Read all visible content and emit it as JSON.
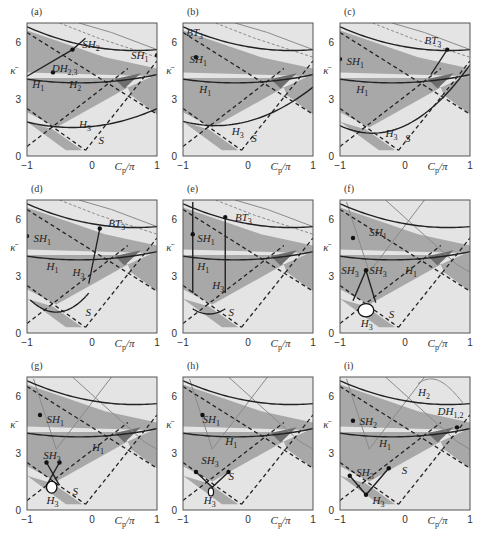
{
  "figure": {
    "colors": {
      "background": "#ffffff",
      "light_region": "#e4e4e4",
      "medium_region": "#a8a8a8",
      "dark_region": "#6e6e6e",
      "curve_solid": "#222222",
      "curve_grey": "#8a8a8a",
      "frame": "#555555"
    },
    "axes": {
      "xlabel": "C_p/π",
      "ylabel": "κ̄",
      "xticks": [
        "−1",
        "0",
        "1"
      ],
      "yticks": [
        "0",
        "3",
        "6"
      ],
      "xlim": [
        -1,
        1
      ],
      "ylim": [
        0,
        7
      ]
    },
    "panels": [
      {
        "id": "a",
        "label": "(a)",
        "curve_labels": [
          "SH2",
          "SH1",
          "DH2,3",
          "H1",
          "H2",
          "H3",
          "S"
        ]
      },
      {
        "id": "b",
        "label": "(b)",
        "curve_labels": [
          "BT3",
          "SH1",
          "H1",
          "H3",
          "S"
        ]
      },
      {
        "id": "c",
        "label": "(c)",
        "curve_labels": [
          "BT3",
          "SH1",
          "H1",
          "H3",
          "S"
        ]
      },
      {
        "id": "d",
        "label": "(d)",
        "curve_labels": [
          "SH1",
          "BT3",
          "H1",
          "H3",
          "S"
        ]
      },
      {
        "id": "e",
        "label": "(e)",
        "curve_labels": [
          "BT3",
          "SH1",
          "H1",
          "H3",
          "S"
        ]
      },
      {
        "id": "f",
        "label": "(f)",
        "curve_labels": [
          "SH1",
          "SH3",
          "SH3",
          "H1",
          "H3",
          "S"
        ]
      },
      {
        "id": "g",
        "label": "(g)",
        "curve_labels": [
          "SH1",
          "SH3",
          "H1",
          "H3",
          "S"
        ]
      },
      {
        "id": "h",
        "label": "(h)",
        "curve_labels": [
          "SH1",
          "SH3",
          "H1",
          "H3",
          "S"
        ]
      },
      {
        "id": "i",
        "label": "(i)",
        "curve_labels": [
          "H2",
          "DH1,2",
          "SH2",
          "H1",
          "SH3",
          "S",
          "H3"
        ]
      }
    ]
  },
  "chart_data": [
    {
      "panel": "(a)",
      "type": "diagram",
      "title": "",
      "xlabel": "C_p/π",
      "ylabel": "κ̄",
      "xlim": [
        -1,
        1
      ],
      "ylim": [
        0,
        7
      ],
      "xticks": [
        -1,
        0,
        1
      ],
      "yticks": [
        0,
        3,
        6
      ],
      "annotations": [
        "SH2",
        "SH1",
        "DH2,3",
        "H1",
        "H2",
        "H3",
        "S"
      ]
    },
    {
      "panel": "(b)",
      "type": "diagram",
      "title": "",
      "xlabel": "C_p/π",
      "ylabel": "κ̄",
      "xlim": [
        -1,
        1
      ],
      "ylim": [
        0,
        7
      ],
      "xticks": [
        -1,
        0,
        1
      ],
      "yticks": [
        0,
        3,
        6
      ],
      "annotations": [
        "BT3",
        "SH1",
        "H1",
        "H3",
        "S"
      ]
    },
    {
      "panel": "(c)",
      "type": "diagram",
      "title": "",
      "xlabel": "C_p/π",
      "ylabel": "κ̄",
      "xlim": [
        -1,
        1
      ],
      "ylim": [
        0,
        7
      ],
      "xticks": [
        -1,
        0,
        1
      ],
      "yticks": [
        0,
        3,
        6
      ],
      "annotations": [
        "BT3",
        "SH1",
        "H1",
        "H3",
        "S"
      ]
    },
    {
      "panel": "(d)",
      "type": "diagram",
      "title": "",
      "xlabel": "C_p/π",
      "ylabel": "κ̄",
      "xlim": [
        -1,
        1
      ],
      "ylim": [
        0,
        7
      ],
      "xticks": [
        -1,
        0,
        1
      ],
      "yticks": [
        0,
        3,
        6
      ],
      "annotations": [
        "SH1",
        "BT3",
        "H1",
        "H3",
        "S"
      ]
    },
    {
      "panel": "(e)",
      "type": "diagram",
      "title": "",
      "xlabel": "C_p/π",
      "ylabel": "κ̄",
      "xlim": [
        -1,
        1
      ],
      "ylim": [
        0,
        7
      ],
      "xticks": [
        -1,
        0,
        1
      ],
      "yticks": [
        0,
        3,
        6
      ],
      "annotations": [
        "BT3",
        "SH1",
        "H1",
        "H3",
        "S"
      ]
    },
    {
      "panel": "(f)",
      "type": "diagram",
      "title": "",
      "xlabel": "C_p/π",
      "ylabel": "κ̄",
      "xlim": [
        -1,
        1
      ],
      "ylim": [
        0,
        7
      ],
      "xticks": [
        -1,
        0,
        1
      ],
      "yticks": [
        0,
        3,
        6
      ],
      "annotations": [
        "SH1",
        "SH3",
        "SH3",
        "H1",
        "H3",
        "S"
      ]
    },
    {
      "panel": "(g)",
      "type": "diagram",
      "title": "",
      "xlabel": "C_p/π",
      "ylabel": "κ̄",
      "xlim": [
        -1,
        1
      ],
      "ylim": [
        0,
        7
      ],
      "xticks": [
        -1,
        0,
        1
      ],
      "yticks": [
        0,
        3,
        6
      ],
      "annotations": [
        "SH1",
        "SH3",
        "H1",
        "H3",
        "S"
      ]
    },
    {
      "panel": "(h)",
      "type": "diagram",
      "title": "",
      "xlabel": "C_p/π",
      "ylabel": "κ̄",
      "xlim": [
        -1,
        1
      ],
      "ylim": [
        0,
        7
      ],
      "xticks": [
        -1,
        0,
        1
      ],
      "yticks": [
        0,
        3,
        6
      ],
      "annotations": [
        "SH1",
        "SH3",
        "H1",
        "H3",
        "S"
      ]
    },
    {
      "panel": "(i)",
      "type": "diagram",
      "title": "",
      "xlabel": "C_p/π",
      "ylabel": "κ̄",
      "xlim": [
        -1,
        1
      ],
      "ylim": [
        0,
        7
      ],
      "xticks": [
        -1,
        0,
        1
      ],
      "yticks": [
        0,
        3,
        6
      ],
      "annotations": [
        "H2",
        "DH1,2",
        "SH2",
        "H1",
        "SH3",
        "S",
        "H3"
      ]
    }
  ]
}
